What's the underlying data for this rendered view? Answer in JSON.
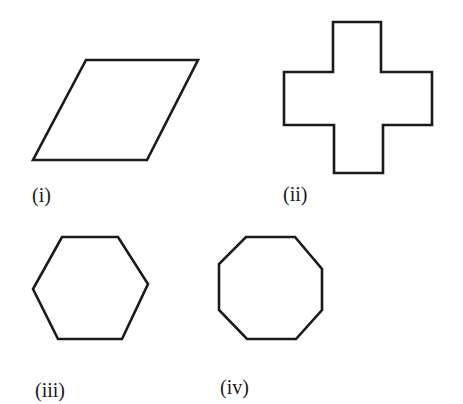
{
  "figures": [
    {
      "id": "i",
      "label": "(i)",
      "shape": "parallelogram",
      "sides": 4
    },
    {
      "id": "ii",
      "label": "(ii)",
      "shape": "cross",
      "sides": 12
    },
    {
      "id": "iii",
      "label": "(iii)",
      "shape": "hexagon",
      "sides": 6
    },
    {
      "id": "iv",
      "label": "(iv)",
      "shape": "octagon",
      "sides": 8
    }
  ],
  "colors": {
    "stroke": "#1a1a1a",
    "background": "#ffffff"
  }
}
